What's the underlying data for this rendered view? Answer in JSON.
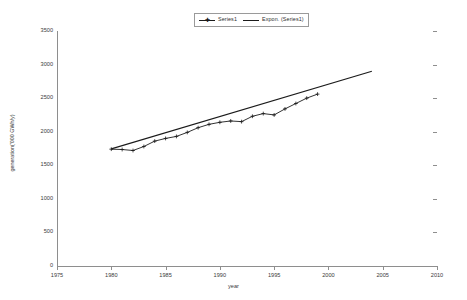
{
  "chart_data": {
    "type": "line",
    "title": "",
    "xlabel": "year",
    "ylabel": "generation('000 GWh/y)",
    "xlim": [
      1975,
      2010
    ],
    "ylim": [
      0,
      3500
    ],
    "xticks": [
      1975,
      1980,
      1985,
      1990,
      1995,
      2000,
      2005,
      2010
    ],
    "yticks": [
      0,
      500,
      1000,
      1500,
      2000,
      2500,
      3000,
      3500
    ],
    "grid": false,
    "legend_position": "top-center",
    "series": [
      {
        "name": "Series1",
        "marker": "cross",
        "x": [
          1980,
          1981,
          1982,
          1983,
          1984,
          1985,
          1986,
          1987,
          1988,
          1989,
          1990,
          1991,
          1992,
          1993,
          1994,
          1995,
          1996,
          1997,
          1998,
          1999
        ],
        "values": [
          1740,
          1735,
          1720,
          1780,
          1860,
          1900,
          1930,
          1990,
          2060,
          2110,
          2140,
          2160,
          2150,
          2230,
          2270,
          2250,
          2340,
          2420,
          2500,
          2560
        ]
      },
      {
        "name": "Expon. (Series1)",
        "marker": "none",
        "trend": true,
        "x": [
          1980,
          2004
        ],
        "values": [
          1745,
          2900
        ]
      }
    ]
  },
  "legend": {
    "entries": [
      {
        "label": "Series1",
        "marker": "cross-marker-line"
      },
      {
        "label": "Expon. (Series1)",
        "marker": "plain-line"
      }
    ]
  },
  "axes": {
    "x_title": "year",
    "y_title": "generation('000 GWh/y)",
    "x_tick_labels": [
      "1975",
      "1980",
      "1985",
      "1990",
      "1995",
      "2000",
      "2005",
      "2010"
    ],
    "y_tick_labels": [
      "0",
      "500",
      "1000",
      "1500",
      "2000",
      "2500",
      "3000",
      "3500"
    ]
  },
  "colors": {
    "series_line": "#1b1b1b",
    "trend_line": "#1b1b1b",
    "axis": "#8e8e8e",
    "text": "#3a3a3a",
    "background": "#ffffff"
  }
}
